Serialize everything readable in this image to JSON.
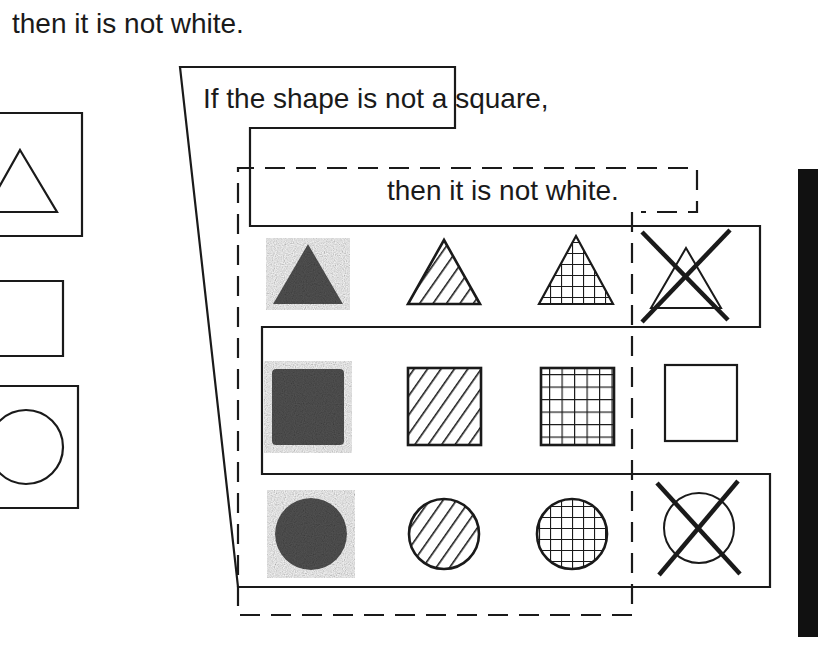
{
  "top_caption": "then it is not white.",
  "rule": {
    "antecedent": "If the shape is not a square,",
    "consequent": "then it is not white."
  },
  "colors": {
    "ink": "#1a1a1a",
    "solid_fill": "#555555",
    "background": "#ffffff",
    "side_bar": "#111111"
  },
  "grid": {
    "rows": [
      {
        "shape": "triangle",
        "cells": [
          {
            "pattern": "solid",
            "crossed": false
          },
          {
            "pattern": "diagonal-hatch",
            "crossed": false
          },
          {
            "pattern": "grid-hatch",
            "crossed": false
          },
          {
            "pattern": "white",
            "crossed": true
          }
        ]
      },
      {
        "shape": "square",
        "cells": [
          {
            "pattern": "solid",
            "crossed": false
          },
          {
            "pattern": "diagonal-hatch",
            "crossed": false
          },
          {
            "pattern": "grid-hatch",
            "crossed": false
          },
          {
            "pattern": "white",
            "crossed": false
          }
        ]
      },
      {
        "shape": "circle",
        "cells": [
          {
            "pattern": "solid",
            "crossed": false
          },
          {
            "pattern": "diagonal-hatch",
            "crossed": false
          },
          {
            "pattern": "grid-hatch",
            "crossed": false
          },
          {
            "pattern": "white",
            "crossed": true
          }
        ]
      }
    ]
  },
  "left_panel": {
    "items": [
      "white triangle",
      "white square",
      "white circle"
    ]
  }
}
